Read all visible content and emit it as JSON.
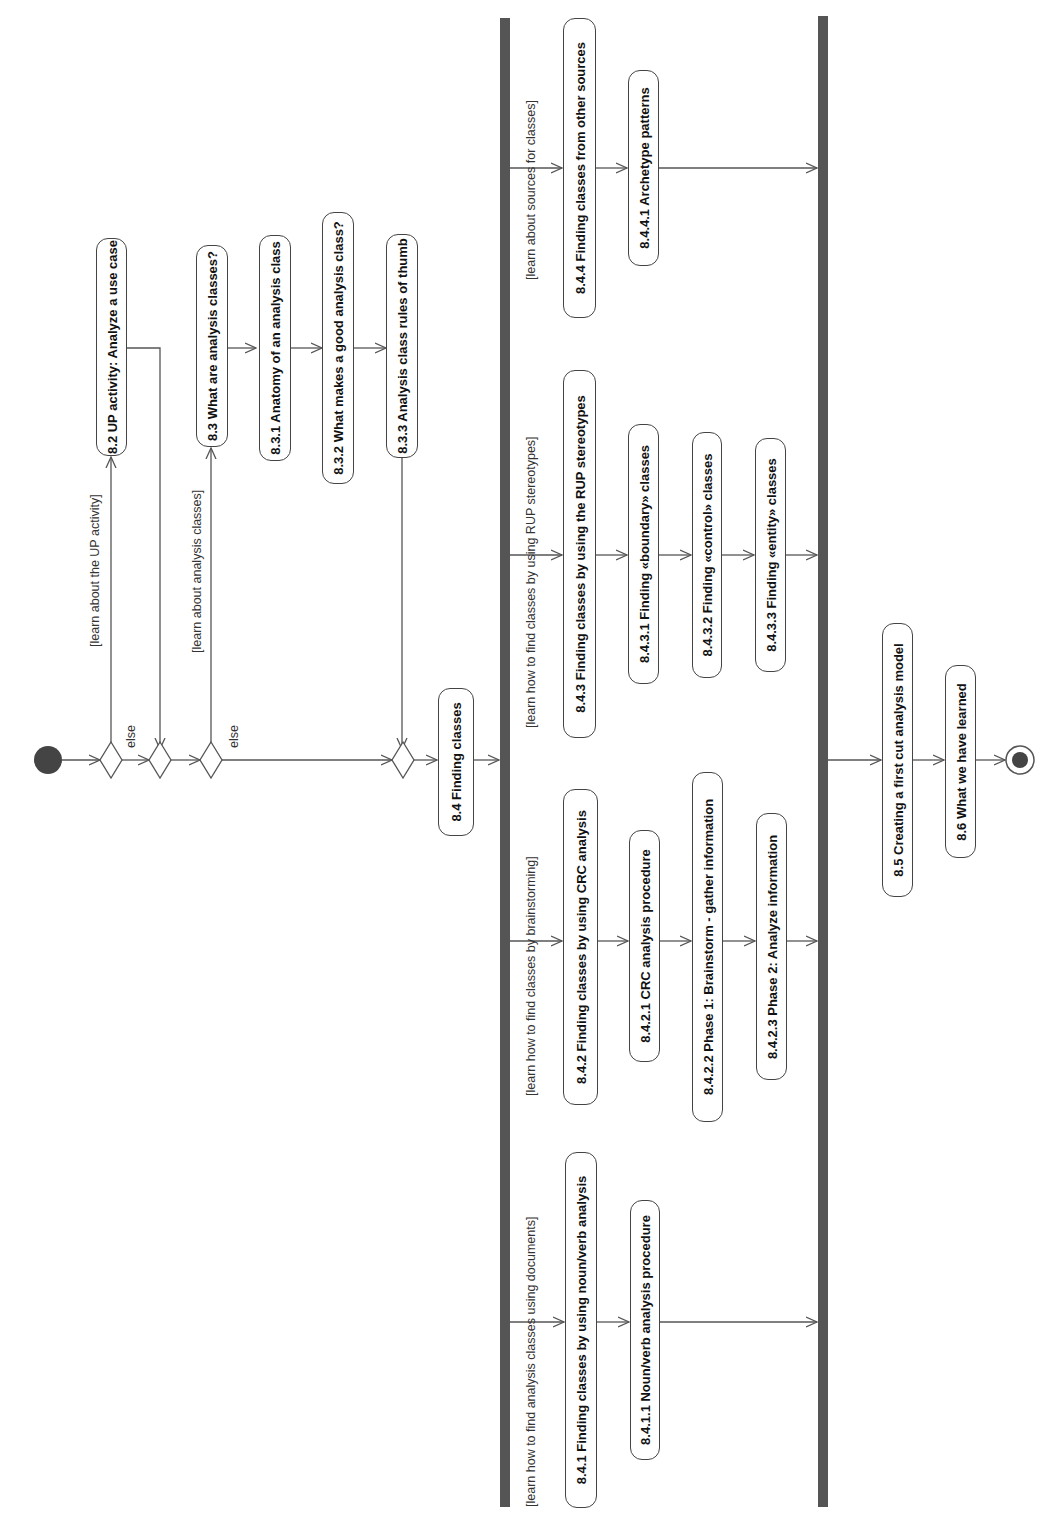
{
  "diagram": {
    "type": "UML activity diagram",
    "orientation": "rotated 90 degrees counter-clockwise",
    "colors": {
      "line": "#555555",
      "bar": "#555555",
      "node_fill": "#444444",
      "text": "#111111"
    }
  },
  "nodes": {
    "start": "initial-node",
    "a82": "8.2 UP activity: Analyze a use case",
    "a83": "8.3 What are analysis classes?",
    "a831": "8.3.1 Anatomy of an analysis class",
    "a832": "8.3.2 What makes a good analysis class?",
    "a833": "8.3.3 Analysis class rules of thumb",
    "a84": "8.4 Finding classes",
    "a841": "8.4.1 Finding classes by using noun/verb analysis",
    "a8411": "8.4.1.1 Noun/verb analysis procedure",
    "a842": "8.4.2 Finding classes by using CRC analysis",
    "a8421": "8.4.2.1 CRC analysis procedure",
    "a8422": "8.4.2.2 Phase 1: Brainstorm - gather information",
    "a8423": "8.4.2.3 Phase 2: Analyze information",
    "a843": "8.4.3 Finding classes by using the RUP stereotypes",
    "a8431": "8.4.3.1 Finding «boundary» classes",
    "a8432": "8.4.3.2 Finding «control» classes",
    "a8433": "8.4.3.3 Finding «entity» classes",
    "a844": "8.4.4 Finding classes from other sources",
    "a8441": "8.4.4.1 Archetype patterns",
    "a85": "8.5 Creating a first cut analysis model",
    "a86": "8.6 What we have learned",
    "end": "final-node"
  },
  "guards": {
    "g_up": "[learn about the UP activity]",
    "g_else1": "else",
    "g_analysis": "[learn about analysis classes]",
    "g_else2": "else",
    "g_documents": "[learn how to find analysis classes using documents]",
    "g_brainstorm": "[learn how to find classes by brainstorming]",
    "g_rup": "[learn how to find classes by using RUP stereotypes]",
    "g_sources": "[learn about sources for classes]"
  }
}
